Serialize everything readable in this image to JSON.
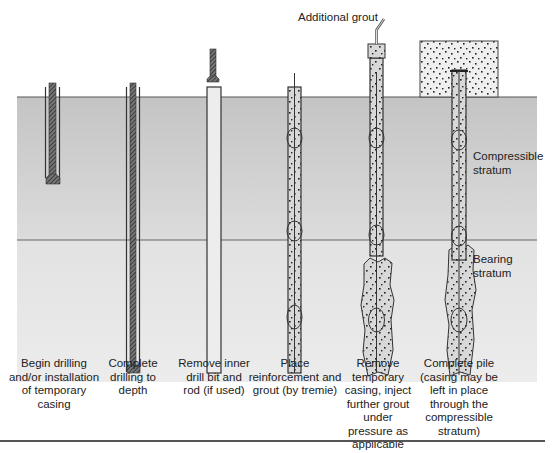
{
  "figure": {
    "type": "pile construction sequence diagram",
    "colors": {
      "upper_soil": "#c9c9c9",
      "lower_soil": "#e6e6e6",
      "casing_line": "#333333",
      "drill_rod": "#555555",
      "grout_fill": "#d6d6d6",
      "dots": "#222222"
    }
  },
  "labels": {
    "additional_grout": "Additional grout",
    "compressible_stratum": [
      "Compressible",
      "stratum"
    ],
    "bearing_stratum": [
      "Bearing",
      "stratum"
    ]
  },
  "steps": [
    {
      "id": 1,
      "caption": [
        "Begin drilling",
        "and/or installation",
        "of temporary",
        "casing"
      ]
    },
    {
      "id": 2,
      "caption": [
        "Complete",
        "drilling to",
        "depth"
      ]
    },
    {
      "id": 3,
      "caption": [
        "Remove inner",
        "drill bit and",
        "rod (if used)"
      ]
    },
    {
      "id": 4,
      "caption": [
        "Place",
        "reinforcement and",
        "grout (by tremie)"
      ]
    },
    {
      "id": 5,
      "caption": [
        "Remove",
        "temporary",
        "casing, inject",
        "further grout",
        "under",
        "pressure as",
        "applicable"
      ]
    },
    {
      "id": 6,
      "caption": [
        "Complete pile",
        "(casing may be",
        "left in place",
        "through the",
        "compressible",
        "stratum)"
      ]
    }
  ]
}
